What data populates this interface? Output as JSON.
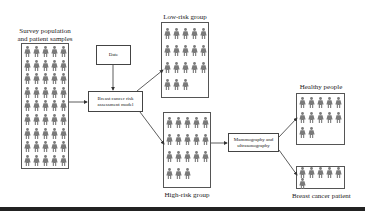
{
  "diagram": {
    "survey": {
      "title_line1": "Survey population",
      "title_line2": "and patient samples",
      "count": 45,
      "cols": 5
    },
    "date_box": {
      "label": "Date"
    },
    "model_box": {
      "line1": "Breast cancer risk",
      "line2": "assessment model"
    },
    "low_risk": {
      "title": "Low-risk group",
      "count": 18,
      "cols": 5
    },
    "high_risk": {
      "title": "High-risk group",
      "count": 18,
      "cols": 5
    },
    "screening_box": {
      "line1": "Mammography and",
      "line2": "ultrasonography"
    },
    "healthy": {
      "title": "Healthy people",
      "count": 12,
      "cols": 5
    },
    "cancer": {
      "title": "Breast cancer patient",
      "count": 6,
      "cols": 5
    }
  },
  "colors": {
    "figure": "#7a7a7a",
    "border": "#555555",
    "line": "#333333",
    "bar": "#222222"
  }
}
